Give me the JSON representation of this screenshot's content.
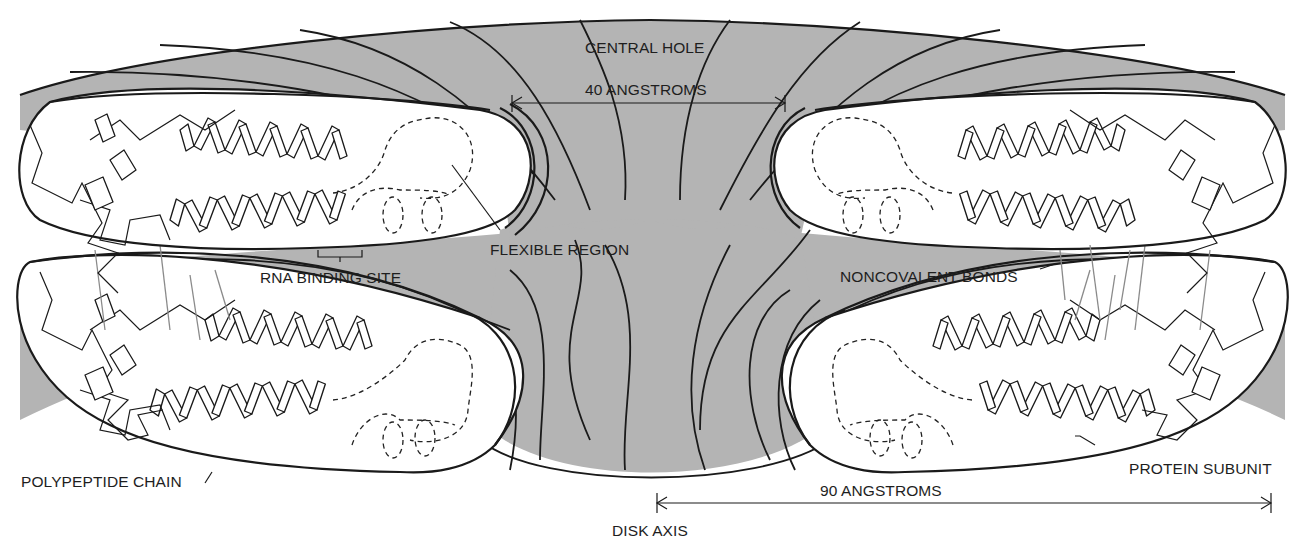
{
  "diagram": {
    "colors": {
      "shading": "#b4b4b4",
      "line": "#1a1a1a",
      "background": "#ffffff",
      "bonds": "#8a8a8a"
    },
    "labels": {
      "central_hole": "CENTRAL HOLE",
      "forty_angstroms": "40 ANGSTROMS",
      "flexible_region": "FLEXIBLE REGION",
      "rna_binding_site": "RNA BINDING SITE",
      "noncovalent_bonds": "NONCOVALENT BONDS",
      "polypeptide_chain": "POLYPEPTIDE CHAIN",
      "protein_subunit": "PROTEIN SUBUNIT",
      "ninety_angstroms": "90 ANGSTROMS",
      "disk_axis": "DISK AXIS"
    },
    "measurements": [
      {
        "label": "40 ANGSTROMS",
        "meaning": "central hole diameter"
      },
      {
        "label": "90 ANGSTROMS",
        "meaning": "disk axis to outer edge of protein subunit"
      }
    ],
    "subunits": [
      {
        "position": "upper-left layer 1"
      },
      {
        "position": "upper-right layer 1"
      },
      {
        "position": "lower-left layer 2"
      },
      {
        "position": "lower-right layer 2"
      }
    ]
  }
}
